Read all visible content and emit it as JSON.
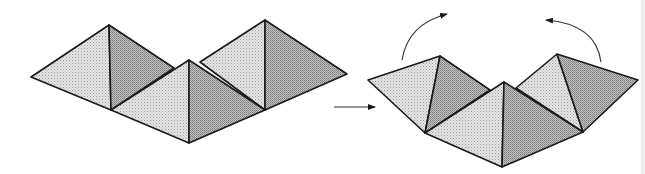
{
  "figure": {
    "left_panel": {
      "label": "flat-net",
      "pyramids": 3,
      "state": "flat"
    },
    "transition_arrow": {
      "direction": "right",
      "meaning": "transforms-to"
    },
    "right_panel": {
      "label": "folded-net",
      "pyramids": 3,
      "state": "folding",
      "rotation_arrows": [
        {
          "side": "left",
          "direction": "clockwise-up"
        },
        {
          "side": "right",
          "direction": "counterclockwise-up"
        }
      ]
    },
    "colors": {
      "light_face": "#dcdcdc",
      "dark_face": "#b4b4b4",
      "outline": "#1a1a1a",
      "background": "#ffffff"
    }
  }
}
